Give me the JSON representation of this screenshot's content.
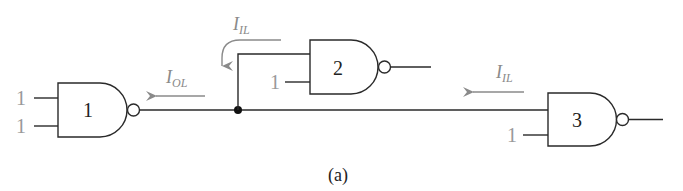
{
  "figure": {
    "caption": "(a)",
    "colors": {
      "wire": "#2a2a2a",
      "current_arrow": "#8a8a8a",
      "input_label": "#999999"
    },
    "gates": [
      {
        "id": "1",
        "label": "1",
        "type": "NAND",
        "inputs": [
          "1",
          "1"
        ]
      },
      {
        "id": "2",
        "label": "2",
        "type": "NAND",
        "inputs": [
          "driven by gate 1",
          "1"
        ]
      },
      {
        "id": "3",
        "label": "3",
        "type": "NAND",
        "inputs": [
          "driven by gate 1",
          "1"
        ]
      }
    ],
    "currents": {
      "gate2_input": {
        "symbol": "I",
        "subscript": "IL"
      },
      "gate1_output": {
        "symbol": "I",
        "subscript": "OL"
      },
      "gate3_input": {
        "symbol": "I",
        "subscript": "IL"
      }
    }
  }
}
